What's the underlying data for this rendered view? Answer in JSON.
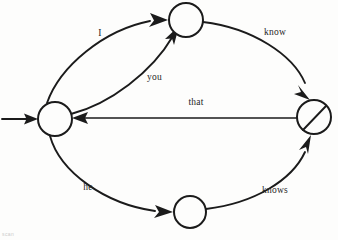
{
  "diagram": {
    "type": "finite-state-automaton",
    "title": "",
    "background_color": "#fdfdfc",
    "line_color": "#1b1b1b",
    "label_color": "#262626",
    "start_marker": {
      "name": "start-arrow",
      "points_to": "q0"
    },
    "nodes": [
      {
        "id": "q0",
        "label": "",
        "cx": 55,
        "cy": 119,
        "r": 17,
        "accepting": false,
        "role": "start-state"
      },
      {
        "id": "q1",
        "label": "",
        "cx": 186,
        "cy": 20,
        "r": 17,
        "accepting": false,
        "role": "state"
      },
      {
        "id": "q2",
        "label": "",
        "cx": 190,
        "cy": 212,
        "r": 16,
        "accepting": false,
        "role": "state"
      },
      {
        "id": "q3",
        "label": "",
        "cx": 314,
        "cy": 117,
        "r": 17,
        "accepting": true,
        "role": "accepting-state"
      }
    ],
    "edges": [
      {
        "id": "e-i",
        "from": "q0",
        "to": "q1",
        "label": "I",
        "label_x": 100,
        "label_y": 36,
        "shape": "arc-upper"
      },
      {
        "id": "e-you",
        "from": "q0",
        "to": "q1",
        "label": "you",
        "label_x": 147,
        "label_y": 80,
        "shape": "arc-inner"
      },
      {
        "id": "e-know",
        "from": "q1",
        "to": "q3",
        "label": "know",
        "label_x": 275,
        "label_y": 35,
        "shape": "arc-upper-right"
      },
      {
        "id": "e-that",
        "from": "q3",
        "to": "q0",
        "label": "that",
        "label_x": 196,
        "label_y": 105,
        "shape": "straight"
      },
      {
        "id": "e-he",
        "from": "q0",
        "to": "q2",
        "label": "he",
        "label_x": 88,
        "label_y": 190,
        "shape": "arc-lower"
      },
      {
        "id": "e-knows",
        "from": "q2",
        "to": "q3",
        "label": "knows",
        "label_x": 275,
        "label_y": 193,
        "shape": "arc-lower-right"
      }
    ],
    "artifact_text": "scan"
  }
}
